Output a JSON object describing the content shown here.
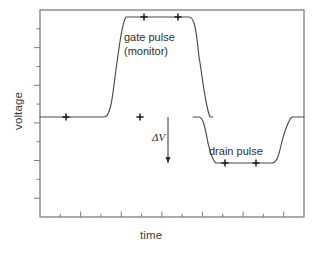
{
  "chart_data": {
    "type": "line",
    "title": "",
    "xlabel": "time",
    "ylabel": "voltage",
    "grid": false,
    "legend": "none",
    "axis": {
      "frame_left": 40,
      "frame_right": 304,
      "frame_top": 10,
      "frame_bottom": 217,
      "x_tick_count": 13,
      "y_tick_count": 11,
      "x_tick_direction": "inward",
      "y_tick_direction": "outward",
      "tick_labels_x": [],
      "tick_labels_y": []
    },
    "levels": {
      "baseline": 117,
      "gate_high": 17,
      "drain_low": 163
    },
    "series": [
      {
        "name": "voltage trace",
        "points": [
          [
            40,
            117
          ],
          [
            104,
            117
          ],
          [
            108,
            112
          ],
          [
            113,
            80
          ],
          [
            118,
            34
          ],
          [
            121,
            21
          ],
          [
            125,
            17
          ],
          [
            180,
            17
          ],
          [
            190,
            17
          ],
          [
            194,
            21
          ],
          [
            197,
            34
          ],
          [
            202,
            80
          ],
          [
            206,
            112
          ],
          [
            210,
            117
          ],
          [
            212,
            117
          ],
          [
            193,
            117
          ],
          [
            199,
            118
          ],
          [
            203,
            126
          ],
          [
            207,
            146
          ],
          [
            210,
            158
          ],
          [
            214,
            163
          ],
          [
            272,
            163
          ],
          [
            276,
            160
          ],
          [
            280,
            148
          ],
          [
            284,
            130
          ],
          [
            288,
            120
          ],
          [
            292,
            117
          ],
          [
            304,
            117
          ]
        ]
      }
    ],
    "markers": [
      {
        "label": "baseline-marker-1",
        "x": 66,
        "y": 117
      },
      {
        "label": "baseline-marker-2",
        "x": 140,
        "y": 117
      },
      {
        "label": "gate-top-marker-1",
        "x": 144,
        "y": 17
      },
      {
        "label": "gate-top-marker-2",
        "x": 178,
        "y": 17
      },
      {
        "label": "drain-bottom-marker-1",
        "x": 225,
        "y": 163
      },
      {
        "label": "drain-bottom-marker-2",
        "x": 256,
        "y": 163
      }
    ],
    "annotations": {
      "gate_pulse_line1": "gate pulse",
      "gate_pulse_line2": "(monitor)",
      "drain_pulse": "drain pulse",
      "delta_v": "ΔV",
      "delta_v_arrow": {
        "x": 168,
        "y_start": 117,
        "y_end": 163,
        "direction": "down"
      }
    },
    "colors": {
      "trace": "#4a4a4a",
      "frame": "#7d7d7d",
      "text": "#2e2e2e",
      "background": "#ffffff"
    }
  }
}
